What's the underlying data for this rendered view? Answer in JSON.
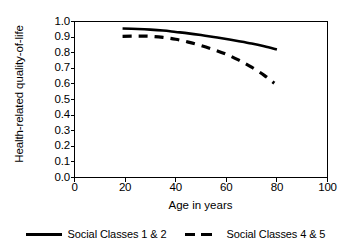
{
  "chart_data": {
    "type": "line",
    "title": "",
    "xlabel": "Age in years",
    "ylabel": "Health-related quality-of-life",
    "xlim": [
      0,
      100
    ],
    "ylim": [
      0.0,
      1.0
    ],
    "xticks": [
      0,
      20,
      40,
      60,
      80,
      100
    ],
    "xticklabels": [
      "0",
      "20",
      "40",
      "60",
      "80",
      "100"
    ],
    "yticks": [
      0.0,
      0.1,
      0.2,
      0.3,
      0.4,
      0.5,
      0.6,
      0.7,
      0.8,
      0.9,
      1.0
    ],
    "yticklabels": [
      "0.0",
      "0.1",
      "0.2",
      "0.3",
      "0.4",
      "0.5",
      "0.6",
      "0.7",
      "0.8",
      "0.9",
      "1.0"
    ],
    "grid": false,
    "legend_position": "below",
    "series": [
      {
        "name": "Social Classes 1 & 2",
        "style": "solid",
        "color": "#000000",
        "x": [
          19,
          25,
          30,
          35,
          40,
          45,
          50,
          55,
          60,
          65,
          70,
          75,
          80
        ],
        "values": [
          0.955,
          0.952,
          0.948,
          0.942,
          0.933,
          0.924,
          0.913,
          0.901,
          0.888,
          0.874,
          0.859,
          0.841,
          0.82
        ]
      },
      {
        "name": "Social Classes 4 & 5",
        "style": "dashed",
        "color": "#000000",
        "x": [
          19,
          25,
          30,
          35,
          40,
          45,
          50,
          55,
          60,
          65,
          70,
          75,
          79
        ],
        "values": [
          0.905,
          0.906,
          0.905,
          0.898,
          0.886,
          0.868,
          0.846,
          0.82,
          0.79,
          0.752,
          0.708,
          0.655,
          0.605
        ]
      }
    ]
  },
  "legend": {
    "items": [
      {
        "label": "Social Classes 1 & 2",
        "style": "solid"
      },
      {
        "label": "Social Classes 4 & 5",
        "style": "dashed"
      }
    ]
  }
}
